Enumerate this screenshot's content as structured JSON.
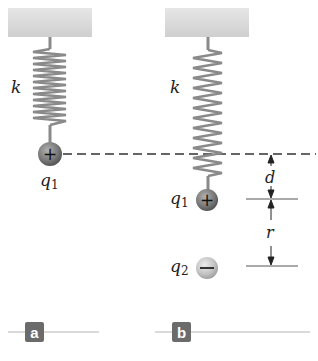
{
  "panels": [
    {
      "id": "a",
      "tag": "a",
      "spring_label": "k",
      "charge_label": "q",
      "charge_sub": "1",
      "charge_sign": "+"
    },
    {
      "id": "b",
      "tag": "b",
      "spring_label": "k",
      "charge1_label": "q",
      "charge1_sub": "1",
      "charge1_sign": "+",
      "charge2_label": "q",
      "charge2_sub": "2",
      "charge2_sign": "−",
      "dimension_d": "d",
      "dimension_r": "r"
    }
  ],
  "colors": {
    "ceiling": "#d9d9d9",
    "spring": "#8a8a8a",
    "positive_charge": "#7a7a7a",
    "negative_charge": "#c4c4c4",
    "tag_bg": "#6b6b6b",
    "rule": "#b5b5b5",
    "dash": "#333333"
  }
}
